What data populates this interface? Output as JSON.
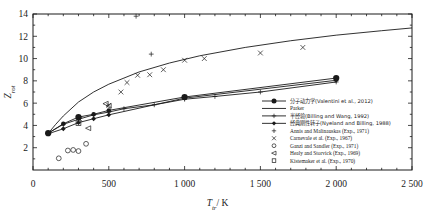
{
  "chart_data": {
    "type": "scatter",
    "title": "",
    "xlabel": "T_tr/K",
    "ylabel": "Z_rot",
    "xlim": [
      0,
      2500
    ],
    "ylim": [
      0,
      14
    ],
    "xticks": [
      0,
      500,
      1000,
      1500,
      2000,
      2500
    ],
    "xticklabels": [
      "0",
      "500",
      "1 000",
      "1 500",
      "2 000",
      "2 500"
    ],
    "yticks": [
      2,
      4,
      6,
      8,
      10,
      12,
      14
    ],
    "yticklabels": [
      "2",
      "4",
      "6",
      "8",
      "10",
      "12",
      "14"
    ],
    "grid": false,
    "legend_position": "right-bottom",
    "series": [
      {
        "name": "分子动力学(Valentini et al., 2012)",
        "kind": "line-marker",
        "marker": "filled-circle",
        "x": [
          100,
          200,
          300,
          400,
          500,
          1000,
          2000
        ],
        "y": [
          3.3,
          4.15,
          4.75,
          5.0,
          5.35,
          6.55,
          8.25
        ]
      },
      {
        "name": "Parker",
        "kind": "line",
        "marker": "none",
        "x": [
          95,
          150,
          200,
          300,
          400,
          500,
          700,
          900,
          1100,
          1400,
          1700,
          2000,
          2300,
          2500
        ],
        "y": [
          3.2,
          4.1,
          4.85,
          6.1,
          7.0,
          7.7,
          8.8,
          9.6,
          10.25,
          11.0,
          11.6,
          12.1,
          12.5,
          12.75
        ]
      },
      {
        "name": "半经验(Billing and Wang, 1992)",
        "kind": "line-marker",
        "marker": "plus-line",
        "x": [
          100,
          200,
          300,
          400,
          500,
          600,
          800,
          1000,
          1200,
          1500,
          2000
        ],
        "y": [
          3.3,
          4.1,
          4.55,
          4.95,
          5.2,
          5.5,
          5.85,
          6.35,
          6.6,
          7.0,
          7.9
        ]
      },
      {
        "name": "经典刚性转子(Nyeland and Billing, 1988)",
        "kind": "line-marker",
        "marker": "filled-diamond",
        "x": [
          100,
          200,
          300,
          400,
          500,
          1000,
          2000
        ],
        "y": [
          3.25,
          3.7,
          4.25,
          4.6,
          4.95,
          6.45,
          8.05
        ]
      },
      {
        "name": "Annis and Malinauskas (Exp., 1971)",
        "kind": "scatter",
        "marker": "plus",
        "x": [
          680,
          780
        ],
        "y": [
          13.8,
          10.4
        ]
      },
      {
        "name": "Carnevale et al. (Exp., 1967)",
        "kind": "scatter",
        "marker": "cross",
        "x": [
          310,
          500,
          580,
          620,
          690,
          770,
          860,
          1000,
          1130,
          1500,
          1780
        ],
        "y": [
          4.55,
          5.8,
          7.0,
          7.85,
          8.5,
          8.55,
          9.0,
          9.85,
          10.0,
          10.5,
          11.0
        ]
      },
      {
        "name": "Ganzi and Sandler (Exp., 1971)",
        "kind": "scatter",
        "marker": "open-circle",
        "x": [
          170,
          230,
          265,
          300,
          350
        ],
        "y": [
          1.05,
          1.75,
          1.8,
          1.7,
          2.35
        ]
      },
      {
        "name": "Healy and Storvick (Exp., 1969)",
        "kind": "scatter",
        "marker": "left-triangle",
        "x": [
          480,
          500,
          365
        ],
        "y": [
          5.95,
          5.75,
          3.75
        ]
      },
      {
        "name": "Kistemaker et al. (Exp., 1970)",
        "kind": "scatter",
        "marker": "open-square",
        "x": [
          300
        ],
        "y": [
          4.2
        ]
      }
    ]
  },
  "axis": {
    "x_label": "T",
    "x_label_sub": "tr",
    "x_label_unit": "/ K",
    "y_label": "Z",
    "y_label_sub": "rot"
  },
  "legend": {
    "items": [
      {
        "label": "分子动力学(Valentini et al., 2012)",
        "marker": "filled-circle-line"
      },
      {
        "label": "Parker",
        "marker": "line"
      },
      {
        "label": "半经验(Billing and Wang, 1992)",
        "marker": "plus-line"
      },
      {
        "label": "经典刚性转子(Nyeland and Billing, 1988)",
        "marker": "filled-diamond-line"
      },
      {
        "label": "Annis and Malinauskas (Exp., 1971)",
        "marker": "plus"
      },
      {
        "label": "Carnevale et al. (Exp., 1967)",
        "marker": "cross"
      },
      {
        "label": "Ganzi and Sandler (Exp., 1971)",
        "marker": "open-circle"
      },
      {
        "label": "Healy and Storvick (Exp., 1969)",
        "marker": "left-triangle"
      },
      {
        "label": "Kistemaker et al. (Exp., 1970)",
        "marker": "open-square"
      }
    ]
  },
  "colors": {
    "ink": "#1a1a1a",
    "background": "#ffffff"
  }
}
